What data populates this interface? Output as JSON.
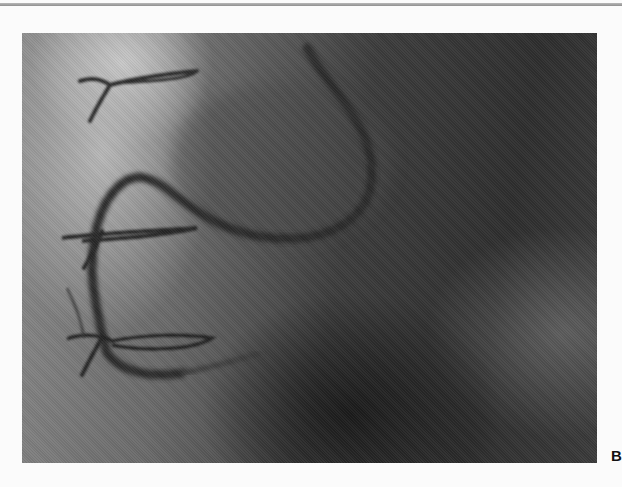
{
  "figure": {
    "panel_label": "B",
    "colors": {
      "background": "#fbfbfb",
      "top_rule": "#a0a0a0",
      "label": "#111111"
    }
  }
}
